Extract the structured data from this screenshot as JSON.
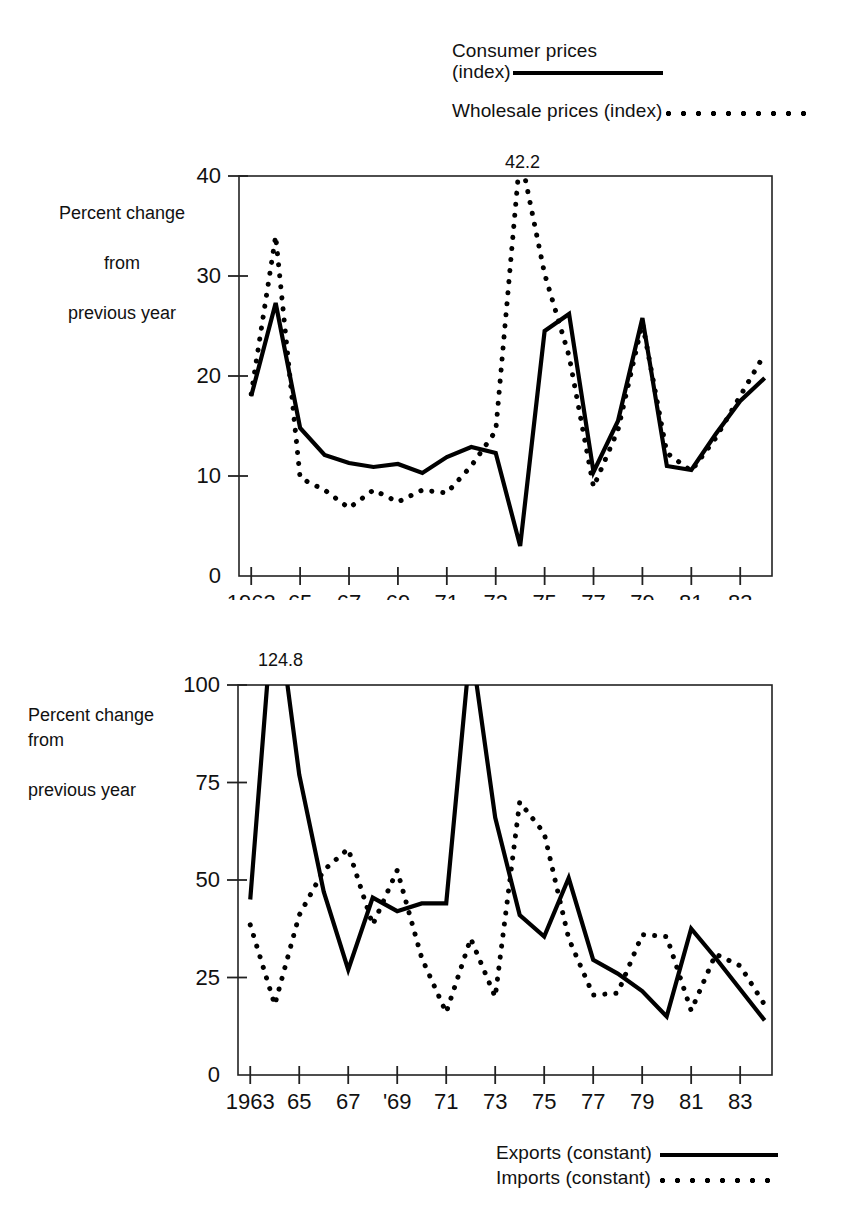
{
  "legend_top": {
    "series1_line1": "Consumer prices",
    "series1_line2": "(index)",
    "series1_style": "solid",
    "series2_label": "Wholesale prices (index)",
    "series2_style": "dotted"
  },
  "legend_bottom": {
    "series1_label": "Exports (constant)",
    "series1_style": "solid",
    "series2_label": "Imports (constant)",
    "series2_style": "dotted"
  },
  "chart_data": [
    {
      "id": "prices",
      "type": "line",
      "title": "",
      "xlabel": "",
      "ylabel": "Percent change\nfrom\nprevious year",
      "ylabel_line1": "Percent change",
      "ylabel_line2": "from",
      "ylabel_line3": "previous year",
      "ylim": [
        0,
        40
      ],
      "yticks": [
        0,
        10,
        20,
        30,
        40
      ],
      "ytick_labels": [
        "0",
        "10",
        "20",
        "30",
        "40"
      ],
      "xlim": [
        1962.5,
        1984.3
      ],
      "xticks": [
        1963,
        1965,
        1967,
        1969,
        1971,
        1973,
        1975,
        1977,
        1979,
        1981,
        1983
      ],
      "xtick_labels": [
        "1963",
        "65",
        "67",
        "69",
        "71",
        "73",
        "75",
        "77",
        "79",
        "81",
        "83"
      ],
      "grid": false,
      "annotations": [
        {
          "text": "42.2",
          "x": 1974,
          "y": 42.2,
          "series": "Wholesale prices (index)"
        }
      ],
      "x": [
        1963,
        1964,
        1965,
        1966,
        1967,
        1968,
        1969,
        1970,
        1971,
        1972,
        1973,
        1974,
        1975,
        1976,
        1977,
        1978,
        1979,
        1980,
        1981,
        1982,
        1983,
        1984
      ],
      "series": [
        {
          "name": "Consumer prices (index)",
          "style": "solid",
          "values": [
            18.0,
            27.3,
            20.0,
            14.8,
            12.1,
            11.3,
            10.9,
            11.2,
            10.3,
            11.9,
            12.9,
            12.3,
            11.9,
            3.0,
            24.5,
            26.2,
            19.0,
            10.4,
            15.5,
            25.8,
            15.0,
            11.0,
            14.2,
            17.5
          ],
          "values_by_year": {
            "1963": 18.0,
            "1964": 27.3,
            "1965": 14.8,
            "1966": 12.1,
            "1967": 11.3,
            "1968": 10.9,
            "1969": 11.2,
            "1970": 10.3,
            "1971": 11.9,
            "1972": 12.9,
            "1973": 12.3,
            "1974": 3.0,
            "1975": 24.5,
            "1976": 26.2,
            "1977": 10.4,
            "1978": 15.5,
            "1979": 25.8,
            "1980": 11.0,
            "1981": 10.6,
            "1982": 14.2,
            "1983": 17.5,
            "1984": 19.8
          }
        },
        {
          "name": "Wholesale prices (index)",
          "style": "dotted",
          "values_by_year": {
            "1963": 18.2,
            "1964": 34.0,
            "1965": 9.8,
            "1966": 8.6,
            "1967": 6.8,
            "1968": 8.6,
            "1969": 7.4,
            "1970": 8.6,
            "1971": 8.3,
            "1972": 11.0,
            "1973": 14.5,
            "1974": 42.2,
            "1975": 30.2,
            "1976": 22.0,
            "1977": 8.9,
            "1978": 14.6,
            "1979": 25.3,
            "1980": 12.3,
            "1981": 10.5,
            "1982": 13.8,
            "1983": 18.0,
            "1984": 22.2
          }
        }
      ]
    },
    {
      "id": "trade",
      "type": "line",
      "title": "",
      "xlabel": "",
      "ylabel": "Percent change\nfrom\nprevious year",
      "ylabel_line1": "Percent change",
      "ylabel_line2": "from",
      "ylabel_line3": "previous year",
      "ylim": [
        0,
        100
      ],
      "yticks": [
        0,
        25,
        50,
        75,
        100
      ],
      "ytick_labels": [
        "0",
        "25",
        "50",
        "75",
        "100"
      ],
      "xlim": [
        1962.5,
        1984.3
      ],
      "xticks": [
        1963,
        1965,
        1967,
        1969,
        1971,
        1973,
        1975,
        1977,
        1979,
        1981,
        1983
      ],
      "xtick_labels": [
        "1963",
        "65",
        "67",
        "'69",
        "71",
        "73",
        "75",
        "77",
        "79",
        "81",
        "83"
      ],
      "grid": false,
      "annotations": [
        {
          "text": "124.8",
          "x": 1964,
          "y": 124.8,
          "series": "Exports (constant)"
        }
      ],
      "series": [
        {
          "name": "Exports (constant)",
          "style": "solid",
          "values_by_year": {
            "1963": 45.0,
            "1964": 124.8,
            "1965": 77.0,
            "1966": 47.0,
            "1967": 27.0,
            "1968": 45.5,
            "1969": 42.0,
            "1970": 44.0,
            "1971": 44.0,
            "1972": 111.0,
            "1973": 66.0,
            "1974": 41.0,
            "1975": 35.5,
            "1976": 50.5,
            "1977": 29.5,
            "1978": 26.0,
            "1979": 21.5,
            "1980": 15.0,
            "1981": 37.5,
            "1982": 30.0,
            "1983": 22.0,
            "1984": 14.0
          }
        },
        {
          "name": "Imports (constant)",
          "style": "dotted",
          "values_by_year": {
            "1963": 38.5,
            "1964": 18.0,
            "1965": 41.0,
            "1966": 52.5,
            "1967": 58.0,
            "1968": 38.5,
            "1969": 52.5,
            "1970": 30.0,
            "1971": 16.0,
            "1972": 35.0,
            "1973": 20.0,
            "1974": 70.0,
            "1975": 62.0,
            "1976": 35.0,
            "1977": 20.5,
            "1978": 21.0,
            "1979": 36.0,
            "1980": 35.5,
            "1981": 16.5,
            "1982": 31.0,
            "1983": 28.0,
            "1984": 18.0
          }
        }
      ]
    }
  ]
}
